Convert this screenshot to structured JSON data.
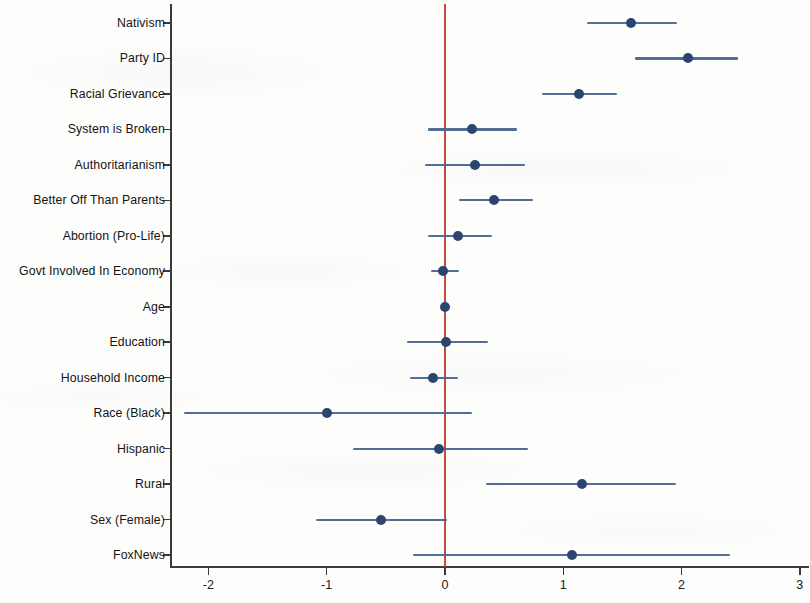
{
  "chart_data": {
    "type": "scatter",
    "subtype": "coefficient-plot",
    "title": "",
    "xlabel": "",
    "ylabel": "",
    "xlim": [
      -2.32,
      3.08
    ],
    "ylim": [
      0,
      16
    ],
    "grid": false,
    "legend": null,
    "reference_line": {
      "x": 0,
      "color": "#c0392b"
    },
    "point_color": "#2c4570",
    "ci_color": "#48678f",
    "axis_color": "#3b3b3b",
    "x_ticks": [
      -2,
      -1,
      0,
      1,
      2,
      3
    ],
    "x_tick_labels": [
      "-2",
      "-1",
      "0",
      "1",
      "2",
      "3"
    ],
    "categories": [
      "Nativism",
      "Party ID",
      "Racial Grievance",
      "System is Broken",
      "Authoritarianism",
      "Better Off Than Parents",
      "Abortion (Pro-Life)",
      "Govt Involved In Economy",
      "Age",
      "Education",
      "Household Income",
      "Race (Black)",
      "Hispanic",
      "Rural",
      "Sex (Female)",
      "FoxNews"
    ],
    "estimates": [
      1.57,
      2.05,
      1.13,
      0.23,
      0.25,
      0.41,
      0.11,
      -0.02,
      0.0,
      0.01,
      -0.1,
      -1.0,
      -0.05,
      1.16,
      -0.54,
      1.07
    ],
    "ci_lower": [
      1.2,
      1.61,
      0.82,
      -0.14,
      -0.17,
      0.12,
      -0.14,
      -0.12,
      0.0,
      -0.32,
      -0.3,
      -2.21,
      -0.78,
      0.35,
      -1.09,
      -0.27
    ],
    "ci_upper": [
      1.96,
      2.48,
      1.45,
      0.61,
      0.68,
      0.74,
      0.4,
      0.12,
      0.0,
      0.36,
      0.11,
      0.23,
      0.7,
      1.95,
      0.02,
      2.41
    ]
  }
}
